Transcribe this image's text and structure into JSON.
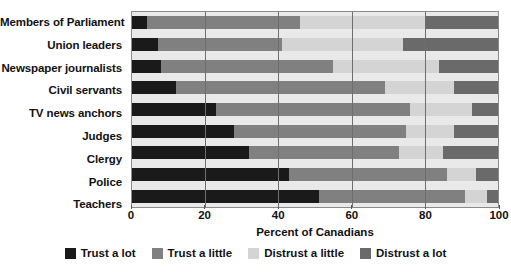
{
  "chart_data": {
    "type": "bar",
    "orientation": "horizontal",
    "stacked": true,
    "title": "",
    "xlabel": "Percent of Canadians",
    "ylabel": "",
    "xlim": [
      0,
      100
    ],
    "xticks": [
      0,
      20,
      40,
      60,
      80,
      100
    ],
    "xtick_labels": [
      "0",
      "20",
      "40",
      "60",
      "80",
      "100"
    ],
    "grid": "vertical",
    "legend_position": "bottom",
    "categories": [
      "Members of Parliament",
      "Union leaders",
      "Newspaper journalists",
      "Civil servants",
      "TV news anchors",
      "Judges",
      "Clergy",
      "Police",
      "Teachers"
    ],
    "series": [
      {
        "name": "Trust a lot",
        "color": "#1a1a1a",
        "values": [
          4,
          7,
          8,
          12,
          23,
          28,
          32,
          43,
          51
        ]
      },
      {
        "name": "Trust a little",
        "color": "#808080",
        "values": [
          42,
          34,
          47,
          57,
          53,
          47,
          41,
          43,
          40
        ]
      },
      {
        "name": "Distrust a little",
        "color": "#d4d4d4",
        "values": [
          34,
          33,
          29,
          19,
          17,
          13,
          12,
          8,
          6
        ]
      },
      {
        "name": "Distrust a lot",
        "color": "#6a6a6a",
        "values": [
          20,
          26,
          16,
          12,
          7,
          12,
          15,
          6,
          3
        ]
      }
    ]
  },
  "colors": {
    "trust_a_lot": "#1a1a1a",
    "trust_a_little": "#808080",
    "distrust_a_little": "#d4d4d4",
    "distrust_a_lot": "#6a6a6a",
    "plot_background": "#e9e9e9",
    "axis": "#8a8a8a",
    "gridline": "#6e6e6e"
  }
}
